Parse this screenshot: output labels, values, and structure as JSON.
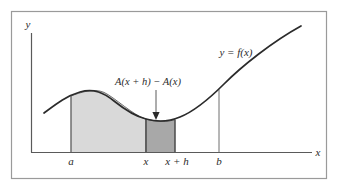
{
  "figure": {
    "frame": {
      "name": "outer-border",
      "x": 11.5,
      "y": 11.5,
      "width": 315,
      "height": 167,
      "stroke": "#9a9a9a",
      "stroke_width": 1.2,
      "fill": "#ffffff"
    },
    "axes": {
      "x_axis": {
        "label": "x",
        "y": 152.5,
        "x_start": 31,
        "x_end": 312,
        "label_x": 318,
        "label_y": 156
      },
      "y_axis": {
        "label": "y",
        "x": 31.5,
        "y_start": 152.5,
        "y_end": 33,
        "label_x": 28,
        "label_y": 28
      },
      "stroke": "#5a5a5a",
      "stroke_width": 1.2
    },
    "curve": {
      "name": "function-curve",
      "label": "y = f(x)",
      "label_x": 236,
      "label_y": 56,
      "stroke": "#2b2b2b",
      "stroke_width": 1.7,
      "path": "M 44,113 C 56,104 66,96 80,92 C 94,88 104,93 114,101 C 124,109 134,116 146,119 C 157,122 168,122 180,117 C 195,111 210,98 224,84 C 242,66 272,42 301,26"
    },
    "regions": [
      {
        "name": "area-a-to-x",
        "fill": "#d9d9d9",
        "stroke": "#6e6e6e",
        "stroke_width": 1.0,
        "path": "M 71,152.5 L 71,96.1 C 80,92.3 94,88 104,92.4 C 114,96.9 134,116 146,119.1 L 146,152.5 Z"
      },
      {
        "name": "area-x-to-x-plus-h",
        "fill": "#a8a8a8",
        "stroke": "#4a4a4a",
        "stroke_width": 1.0,
        "path": "M 146,152.5 L 146,119.1 C 157,122 168,122 175,119.6 L 175,152.5 Z"
      }
    ],
    "verticals": [
      {
        "name": "ordinate-a",
        "x": 71,
        "y_top": 96.1,
        "y_bottom": 152.5
      },
      {
        "name": "ordinate-x",
        "x": 146,
        "y_top": 119.1,
        "y_bottom": 152.5
      },
      {
        "name": "ordinate-x-plus-h",
        "x": 175,
        "y_top": 119.6,
        "y_bottom": 152.5
      },
      {
        "name": "ordinate-b",
        "x": 219,
        "y_top": 89.5,
        "y_bottom": 152.5
      }
    ],
    "tick_labels": [
      {
        "name": "tick-label-a",
        "text": "a",
        "x": 71,
        "y": 165
      },
      {
        "name": "tick-label-x",
        "text": "x",
        "x": 146,
        "y": 165
      },
      {
        "name": "tick-label-x-plus-h",
        "text": "x + h",
        "x": 177,
        "y": 165
      },
      {
        "name": "tick-label-b",
        "text": "b",
        "x": 219,
        "y": 165
      }
    ],
    "annotation": {
      "name": "area-increment-annotation",
      "text": "A(x + h) − A(x)",
      "text_x": 148,
      "text_y": 85,
      "leader_line": {
        "x1": 156,
        "y1": 90,
        "x2": 156,
        "y2": 114
      },
      "arrow_head": "M 152.4,112 L 159.6,112 L 156,120 Z",
      "stroke": "#5a5a5a",
      "fill": "#2b2b2b"
    }
  }
}
